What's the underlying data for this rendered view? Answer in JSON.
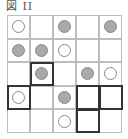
{
  "title": "図 II",
  "grid": {
    "rows": 5,
    "cols": 5,
    "cells": [
      [
        "white",
        "",
        "gray",
        "",
        "gray"
      ],
      [
        "gray",
        "gray",
        "white",
        "",
        ""
      ],
      [
        "",
        "gray",
        "",
        "gray",
        "white"
      ],
      [
        "white",
        "",
        "gray",
        "",
        ""
      ],
      [
        "",
        "",
        "white",
        "",
        ""
      ]
    ],
    "bold_outlines": [
      {
        "row": 2,
        "col": 1
      },
      {
        "row": 3,
        "col": 0
      },
      {
        "row": 3,
        "col": 3
      },
      {
        "row": 3,
        "col": 4
      },
      {
        "row": 4,
        "col": 3
      }
    ]
  },
  "colors": {
    "gray_circle": "#a9a9a9",
    "white_circle": "#ffffff",
    "grid_line": "#bdbdbd",
    "bold_line": "#333333"
  }
}
